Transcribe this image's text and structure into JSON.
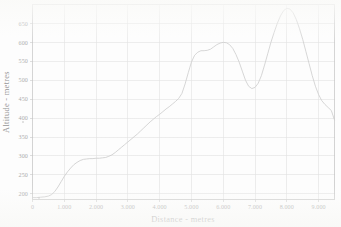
{
  "chart_data": {
    "type": "line",
    "title": "",
    "subtitle": "",
    "xlabel": "Distance - metres",
    "ylabel": "Altitude - metres",
    "xlim": [
      0,
      9500
    ],
    "ylim": [
      185,
      700
    ],
    "grid": true,
    "legend": "none",
    "x_tick_labels": [
      "0",
      "1.000",
      "2.000",
      "3.000",
      "4.000",
      "5.000",
      "6.000",
      "7.000",
      "8.000",
      "9.000"
    ],
    "x_tick_values": [
      0,
      1000,
      2000,
      3000,
      4000,
      5000,
      6000,
      7000,
      8000,
      9000
    ],
    "y_tick_labels": [
      "200",
      "250",
      "300",
      "350",
      "400",
      "450",
      "500",
      "550",
      "600",
      "650"
    ],
    "y_tick_values": [
      200,
      250,
      300,
      350,
      400,
      450,
      500,
      550,
      600,
      650
    ],
    "series": [
      {
        "name": "Altitude profile",
        "color": "#c4c4c4",
        "x": [
          0,
          120,
          250,
          380,
          500,
          600,
          700,
          800,
          900,
          1000,
          1100,
          1200,
          1300,
          1400,
          1500,
          1600,
          1700,
          1800,
          1900,
          2000,
          2100,
          2200,
          2300,
          2400,
          2500,
          2600,
          2700,
          2800,
          2900,
          3000,
          3100,
          3200,
          3300,
          3400,
          3500,
          3600,
          3700,
          3800,
          3900,
          4000,
          4100,
          4200,
          4300,
          4400,
          4500,
          4600,
          4700,
          4800,
          4900,
          5000,
          5100,
          5200,
          5300,
          5400,
          5500,
          5600,
          5700,
          5800,
          5900,
          6000,
          6100,
          6200,
          6300,
          6400,
          6500,
          6600,
          6700,
          6800,
          6900,
          7000,
          7100,
          7200,
          7300,
          7400,
          7500,
          7600,
          7700,
          7800,
          7900,
          8000,
          8100,
          8200,
          8300,
          8400,
          8500,
          8600,
          8700,
          8800,
          8900,
          9000,
          9100,
          9200,
          9300,
          9400,
          9500
        ],
        "y": [
          190,
          190,
          191,
          192,
          194,
          198,
          206,
          218,
          232,
          246,
          258,
          268,
          277,
          283,
          288,
          291,
          292,
          293,
          293,
          294,
          294,
          295,
          296,
          299,
          303,
          309,
          316,
          323,
          330,
          337,
          344,
          351,
          358,
          366,
          374,
          382,
          390,
          397,
          404,
          410,
          417,
          424,
          430,
          437,
          444,
          452,
          465,
          490,
          520,
          548,
          566,
          574,
          578,
          578,
          579,
          582,
          588,
          594,
          598,
          600,
          599,
          594,
          584,
          568,
          548,
          524,
          500,
          484,
          478,
          481,
          492,
          512,
          540,
          570,
          600,
          626,
          650,
          670,
          684,
          690,
          688,
          678,
          660,
          636,
          608,
          576,
          544,
          512,
          484,
          462,
          446,
          436,
          428,
          420,
          395
        ],
        "annotations": [
          {
            "label": "start plateau",
            "x": 2000,
            "y": 294
          },
          {
            "label": "local maximum",
            "x": 6000,
            "y": 600
          },
          {
            "label": "saddle minimum",
            "x": 6900,
            "y": 478
          },
          {
            "label": "global maximum",
            "x": 8000,
            "y": 690
          },
          {
            "label": "end",
            "x": 9500,
            "y": 395
          }
        ]
      }
    ]
  },
  "axes": {
    "x_title": "Distance - metres",
    "y_title": "Altitude - metres"
  },
  "colors": {
    "line": "#c4c4c4",
    "grid": "#dcdcdc",
    "frame": "#b9b9b9",
    "text": "#9a9a9a",
    "background": "#fdfdfd"
  }
}
